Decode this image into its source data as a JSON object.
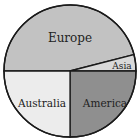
{
  "chart_data": {
    "type": "pie",
    "title": "",
    "slices": [
      {
        "label": "Europe",
        "value": 46,
        "color": "#c2c2c2"
      },
      {
        "label": "Asia",
        "value": 4,
        "color": "#d9d9d9"
      },
      {
        "label": "America",
        "value": 25,
        "color": "#8f8f8f"
      },
      {
        "label": "Australia",
        "value": 25,
        "color": "#ececec"
      }
    ],
    "legend": "none",
    "labels_inside": true
  }
}
